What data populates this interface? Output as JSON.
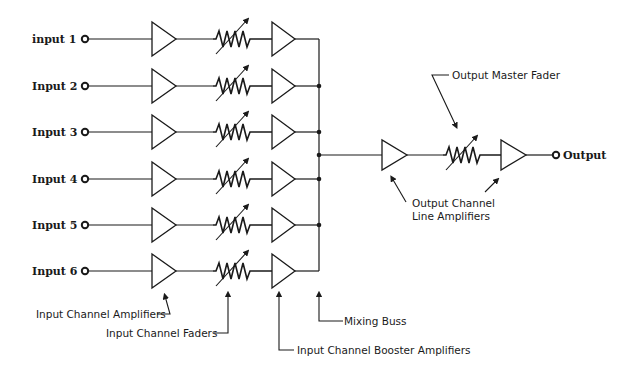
{
  "diagram": {
    "inputs": [
      {
        "label": "input 1",
        "y": 39
      },
      {
        "label": "Input 2",
        "y": 86
      },
      {
        "label": "Input 3",
        "y": 132
      },
      {
        "label": "Input 4",
        "y": 179
      },
      {
        "label": "Input 5",
        "y": 225
      },
      {
        "label": "Input 6",
        "y": 271
      }
    ],
    "output": {
      "label": "Output",
      "y": 155
    },
    "annotations": {
      "input_channel_amplifiers": "Input Channel Amplifiers",
      "input_channel_faders": "Input Channel Faders",
      "input_channel_booster_amplifiers": "Input Channel Booster Amplifiers",
      "mixing_buss": "Mixing Buss",
      "output_master_fader": "Output Master Fader",
      "output_channel_line_amplifiers_1": "Output Channel",
      "output_channel_line_amplifiers_2": "Line Amplifiers"
    },
    "colors": {
      "ink": "#1a1a1a",
      "background": "#ffffff"
    }
  }
}
